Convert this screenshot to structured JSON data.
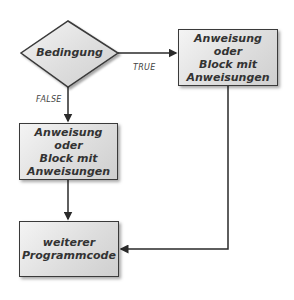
{
  "diagram": {
    "type": "flowchart",
    "decision": {
      "label": "Bedingung"
    },
    "branches": {
      "true_label": "TRUE",
      "false_label": "FALSE"
    },
    "true_block": {
      "label": "Anweisung oder\nBlock mit\nAnweisungen"
    },
    "false_block": {
      "label": "Anweisung oder\nBlock mit\nAnweisungen"
    },
    "end_block": {
      "label": "weiterer\nProgrammcode"
    },
    "colors": {
      "stroke": "#3a3a3a",
      "fill": "#dedede",
      "text": "#333333"
    }
  }
}
